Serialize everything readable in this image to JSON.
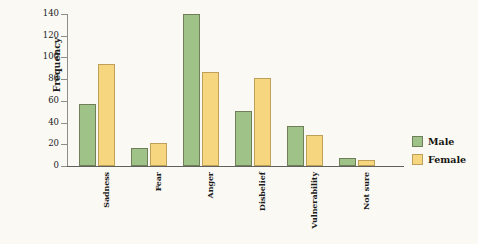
{
  "chart_data": {
    "type": "bar",
    "title": "",
    "subtitle": "",
    "xlabel": "",
    "ylabel": "Frequency",
    "ylim": [
      0,
      140
    ],
    "yticks": [
      0,
      20,
      40,
      60,
      80,
      100,
      120,
      140
    ],
    "grid": false,
    "legend_position": "right",
    "categories": [
      "Sadness",
      "Fear",
      "Anger",
      "Disbelief",
      "Vulnerability",
      "Not sure"
    ],
    "series": [
      {
        "name": "Male",
        "color": "#9ec288",
        "border_color": "#6f7f59",
        "values": [
          57,
          17,
          140,
          51,
          37,
          7
        ]
      },
      {
        "name": "Female",
        "color": "#f6d77f",
        "border_color": "#bfa05a",
        "values": [
          94,
          21,
          87,
          81,
          29,
          6
        ]
      }
    ]
  },
  "legend": {
    "entries": [
      {
        "label": "Male",
        "swatch": "male"
      },
      {
        "label": "Female",
        "swatch": "female"
      }
    ]
  },
  "colors": {
    "background": "#faf9f4",
    "axis": "#5f625c",
    "text": "#1b1b1b",
    "male": "#9ec288",
    "female": "#f6d77f"
  }
}
